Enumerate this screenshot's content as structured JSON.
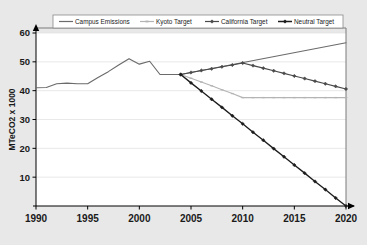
{
  "chart_data": {
    "type": "line",
    "title": "",
    "xlabel": "",
    "ylabel": "MTeCO2 x 1000",
    "xlim": [
      1990,
      2020
    ],
    "ylim": [
      0,
      60
    ],
    "xticks": [
      "1990",
      "1995",
      "2000",
      "2005",
      "2010",
      "2015",
      "2020"
    ],
    "yticks": [
      "10",
      "20",
      "30",
      "40",
      "50",
      "60"
    ],
    "grid": true,
    "legend_position": "top",
    "series": [
      {
        "name": "Campus Emissions",
        "color": "#6b6b6b",
        "marker": "none",
        "x": [
          1990,
          1991,
          1992,
          1993,
          1994,
          1995,
          1996,
          1997,
          1998,
          1999,
          2000,
          2001,
          2002,
          2003,
          2004,
          2020
        ],
        "values": [
          41.0,
          41.1,
          42.4,
          42.6,
          42.4,
          42.4,
          44.6,
          46.6,
          48.9,
          51.1,
          49.2,
          50.2,
          45.6,
          45.6,
          45.6,
          56.6
        ]
      },
      {
        "name": "Kyoto Target",
        "color": "#b4b4b4",
        "marker": "dash",
        "x": [
          2004,
          2005,
          2006,
          2007,
          2008,
          2009,
          2010,
          2011,
          2012,
          2013,
          2014,
          2015,
          2016,
          2017,
          2018,
          2019,
          2020
        ],
        "values": [
          45.6,
          44.3,
          43.0,
          41.7,
          40.3,
          39.0,
          37.6,
          37.6,
          37.6,
          37.6,
          37.6,
          37.6,
          37.6,
          37.6,
          37.6,
          37.6,
          37.6
        ]
      },
      {
        "name": "California Target",
        "color": "#4a4a4a",
        "marker": "diamond",
        "x": [
          2004,
          2005,
          2006,
          2007,
          2008,
          2009,
          2010,
          2011,
          2012,
          2013,
          2014,
          2015,
          2016,
          2017,
          2018,
          2019,
          2020
        ],
        "values": [
          45.6,
          46.3,
          47.0,
          47.6,
          48.3,
          48.9,
          49.6,
          48.7,
          47.8,
          46.9,
          46.0,
          45.1,
          44.2,
          43.3,
          42.4,
          41.5,
          40.6
        ]
      },
      {
        "name": "Neutral Target",
        "color": "#1c1c1c",
        "marker": "diamond",
        "x": [
          2004,
          2005,
          2006,
          2007,
          2008,
          2009,
          2010,
          2011,
          2012,
          2013,
          2014,
          2015,
          2016,
          2017,
          2018,
          2019,
          2020
        ],
        "values": [
          45.6,
          42.7,
          39.9,
          37.0,
          34.2,
          31.3,
          28.5,
          25.6,
          22.8,
          19.9,
          17.1,
          14.2,
          11.4,
          8.5,
          5.7,
          2.8,
          0.0
        ]
      }
    ]
  },
  "legend": {
    "items": [
      {
        "label": "Campus Emissions"
      },
      {
        "label": "Kyoto Target"
      },
      {
        "label": "California Target"
      },
      {
        "label": "Neutral Target"
      }
    ]
  },
  "colors": {
    "background": "#e8e8e8",
    "plot_area": "#ffffff",
    "axis": "#000000",
    "grid": "#e0e0e0",
    "campus_emissions": "#6b6b6b",
    "kyoto_target": "#b4b4b4",
    "california_target": "#4a4a4a",
    "neutral_target": "#1c1c1c"
  }
}
